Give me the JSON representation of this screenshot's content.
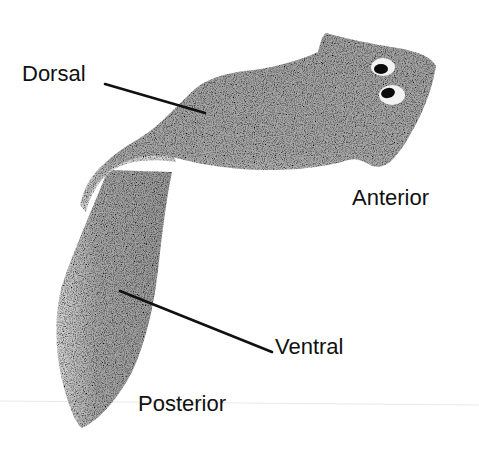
{
  "diagram": {
    "colors": {
      "background": "#ffffff",
      "body_fill": "#a9a9a9",
      "body_light": "#d2d2d2",
      "body_dark": "#8f8f8f",
      "eye_pupil": "#0a0a0a",
      "eye_white": "#f2f2f2",
      "label_text": "#111111",
      "leader_line": "#111111",
      "scan_line": "#e6e6e6"
    },
    "labels": {
      "dorsal": "Dorsal",
      "anterior": "Anterior",
      "ventral": "Ventral",
      "posterior": "Posterior"
    }
  }
}
